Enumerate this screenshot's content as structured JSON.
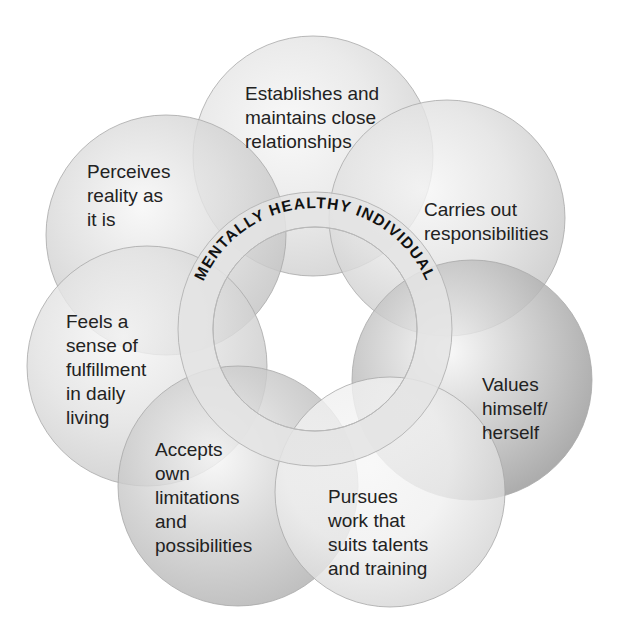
{
  "title": "MENTALLY HEALTHY INDIVIDUAL",
  "circles": [
    {
      "id": "relationships",
      "label": "Establishes and\nmaintains close\nrelationships",
      "cx": 313,
      "cy": 156,
      "r": 120,
      "color": "#e6e6e6",
      "edge": "#cfcfcf"
    },
    {
      "id": "perceives",
      "label": "Perceives\nreality as\nit is",
      "cx": 166,
      "cy": 235,
      "r": 120,
      "color": "#dcdcdc",
      "edge": "#c4c4c4"
    },
    {
      "id": "responsibilities",
      "label": "Carries out\nresponsibilities",
      "cx": 447,
      "cy": 218,
      "r": 118,
      "color": "#e2e2e2",
      "edge": "#c8c8c8"
    },
    {
      "id": "fulfillment",
      "label": "Feels a\nsense of\nfulfillment\nin daily\nliving",
      "cx": 147,
      "cy": 366,
      "r": 120,
      "color": "#e2e2e2",
      "edge": "#cacaca"
    },
    {
      "id": "values",
      "label": "Values\nhimself/\nherself",
      "cx": 472,
      "cy": 380,
      "r": 120,
      "color": "#c4c4c4",
      "edge": "#9a9a9a"
    },
    {
      "id": "limitations",
      "label": "Accepts\nown\nlimitations\nand\npossibilities",
      "cx": 238,
      "cy": 486,
      "r": 120,
      "color": "#cfcfcf",
      "edge": "#b2b2b2"
    },
    {
      "id": "work",
      "label": "Pursues\nwork that\nsuits talents\nand training",
      "cx": 390,
      "cy": 492,
      "r": 115,
      "color": "#f0f0f0",
      "edge": "#d6d6d6"
    }
  ],
  "labels": [
    {
      "id": "relationships",
      "x": 245,
      "y": 82
    },
    {
      "id": "perceives",
      "x": 87,
      "y": 160
    },
    {
      "id": "responsibilities",
      "x": 424,
      "y": 198
    },
    {
      "id": "fulfillment",
      "x": 66,
      "y": 310
    },
    {
      "id": "values",
      "x": 482,
      "y": 373
    },
    {
      "id": "limitations",
      "x": 155,
      "y": 438
    },
    {
      "id": "work",
      "x": 328,
      "y": 485
    }
  ],
  "ring": {
    "cx": 315,
    "cy": 329,
    "outer_r": 137,
    "inner_r": 102,
    "text_r": 121,
    "fill": "#e4e4e4",
    "stroke": "#b8b8b8"
  },
  "colors": {
    "text": "#222222",
    "background": "#ffffff",
    "title_text": "#111111"
  }
}
